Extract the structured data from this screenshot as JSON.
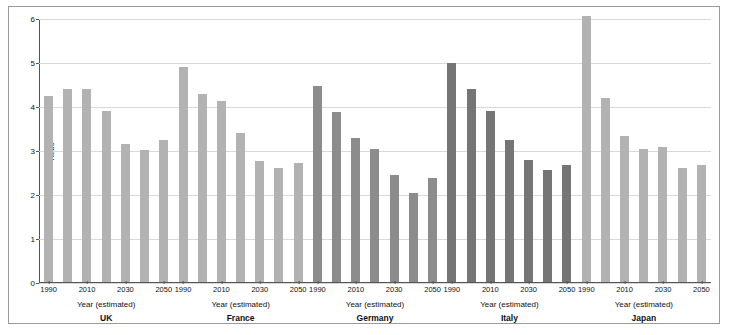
{
  "figure": {
    "y_axis_label": "Ratio",
    "x_axis_title": "Year (estimated)"
  },
  "chart_data": {
    "type": "bar",
    "title": "",
    "xlabel": "Year (estimated)",
    "ylabel": "Ratio",
    "ylim": [
      0,
      6
    ],
    "yticks": [
      0,
      1,
      2,
      3,
      4,
      5,
      6
    ],
    "xticks_labeled": [
      "1990",
      "2010",
      "2030",
      "2050"
    ],
    "grid": true,
    "legend": "none",
    "categories": [
      "1990",
      "2000",
      "2010",
      "2020",
      "2030",
      "2040",
      "2050"
    ],
    "panels": [
      {
        "name": "UK",
        "color": "#b2b2b2",
        "values": [
          4.25,
          4.4,
          4.4,
          3.9,
          3.15,
          3.03,
          3.25
        ]
      },
      {
        "name": "France",
        "color": "#b2b2b2",
        "values": [
          4.9,
          4.3,
          4.13,
          3.4,
          2.78,
          2.62,
          2.73
        ]
      },
      {
        "name": "Germany",
        "color": "#8c8c8c",
        "values": [
          4.47,
          3.88,
          3.3,
          3.05,
          2.45,
          2.05,
          2.38
        ]
      },
      {
        "name": "Italy",
        "color": "#757575",
        "values": [
          5.0,
          4.4,
          3.9,
          3.25,
          2.8,
          2.57,
          2.68
        ]
      },
      {
        "name": "Japan",
        "color": "#b2b2b2",
        "values": [
          6.07,
          4.2,
          3.35,
          3.05,
          3.08,
          2.62,
          2.68
        ]
      }
    ]
  }
}
